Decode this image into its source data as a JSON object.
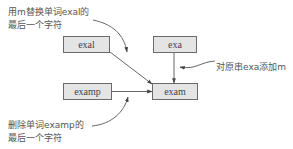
{
  "diagram": {
    "nodes": {
      "exal": "exal",
      "exa": "exa",
      "examp": "examp",
      "exam": "exam"
    },
    "annotations": {
      "replace": {
        "line1": "用m替换单词exal的",
        "line2": "最后一个字符"
      },
      "append": {
        "line1": "对原串exa添加m"
      },
      "delete": {
        "line1": "删除单词examp的",
        "line2": "最后一个字符"
      }
    },
    "edges": [
      {
        "from": "exal",
        "to": "exam",
        "operation": "replace"
      },
      {
        "from": "exa",
        "to": "exam",
        "operation": "append"
      },
      {
        "from": "examp",
        "to": "exam",
        "operation": "delete"
      }
    ],
    "colors": {
      "node_fill": "#e4e4e4",
      "node_border": "#6a6a6a",
      "line": "#555555",
      "text": "#444444"
    }
  }
}
